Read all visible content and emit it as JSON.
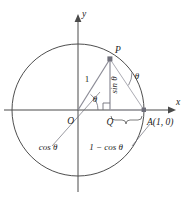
{
  "figure": {
    "type": "geometry-diagram",
    "axes": {
      "x_label": "x",
      "y_label": "y"
    },
    "points": {
      "origin_label": "O",
      "p_label": "P",
      "q_label": "Q",
      "a_label": "A(1, 0)"
    },
    "labels": {
      "radius": "1",
      "angle_origin": "θ",
      "angle_chord": "θ",
      "opposite_side": "sin θ",
      "adjacent_side": "cos θ",
      "remainder_side": "1 − cos θ"
    },
    "colors": {
      "axis": "#4a4a4a",
      "circle": "#3a3a3a",
      "segment": "#8b8b96",
      "text": "#1c1c1c",
      "background": "#ffffff"
    },
    "geometry": {
      "center_x": 78,
      "center_y": 110,
      "radius": 66,
      "p_x": 110,
      "p_y": 59,
      "q_x": 110,
      "q_y": 110,
      "a_x": 144,
      "a_y": 110
    }
  }
}
